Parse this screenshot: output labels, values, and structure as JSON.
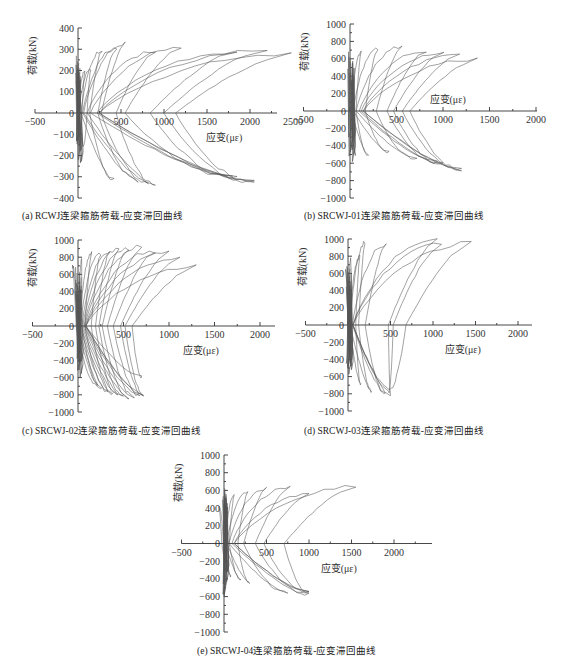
{
  "figure": {
    "panels": [
      {
        "id": "a",
        "caption": "(a) RCWJ连梁箍筋荷载-应变滞回曲线"
      },
      {
        "id": "b",
        "caption": "(b) SRCWJ-01连梁箍筋荷载-应变滞回曲线"
      },
      {
        "id": "c",
        "caption": "(c) SRCWJ-02连梁箍筋荷载-应变滞回曲线"
      },
      {
        "id": "d",
        "caption": "(d) SRCWJ-03连梁箍筋荷载-应变滞回曲线"
      },
      {
        "id": "e",
        "caption": "(e) SRCWJ-04连梁箍筋荷载-应变滞回曲线"
      }
    ]
  },
  "chart_data": [
    {
      "id": "a",
      "type": "line",
      "title": "(a) RCWJ连梁箍筋荷载-应变滞回曲线",
      "xlabel": "应变(με)",
      "ylabel": "荷载(kN)",
      "xticks": [
        -500,
        0,
        500,
        1000,
        1500,
        2000,
        2500
      ],
      "xtick_labels": [
        "-500",
        "",
        "500",
        "1000",
        "1500",
        "2000",
        "2500"
      ],
      "yticks": [
        -400,
        -300,
        -200,
        -100,
        0,
        100,
        200,
        300,
        400
      ],
      "ylim": [
        -400,
        400
      ],
      "xlim": [
        -500,
        2800
      ],
      "grid": false,
      "frame": {
        "x0": 78,
        "y_top": 28,
        "y_bot": 198,
        "px_per_500": 43,
        "x_axis_end": 277
      },
      "loops": [
        {
          "peak_strain": 80,
          "peak_load": 200,
          "neg_strain": 20,
          "neg_load": -180
        },
        {
          "peak_strain": 150,
          "peak_load": 210,
          "neg_strain": 60,
          "neg_load": -160
        },
        {
          "peak_strain": 280,
          "peak_load": 300,
          "neg_strain": 420,
          "neg_load": -320
        },
        {
          "peak_strain": 450,
          "peak_load": 310,
          "neg_strain": 700,
          "neg_load": -320
        },
        {
          "peak_strain": 550,
          "peak_load": 330,
          "neg_strain": 820,
          "neg_load": -330
        },
        {
          "peak_strain": 900,
          "peak_load": 290,
          "neg_strain": 900,
          "neg_load": -340
        },
        {
          "peak_strain": 1200,
          "peak_load": 310,
          "neg_strain": 1800,
          "neg_load": -300
        },
        {
          "peak_strain": 1850,
          "peak_load": 290,
          "neg_strain": 1850,
          "neg_load": -310
        },
        {
          "peak_strain": 2200,
          "peak_load": 300,
          "neg_strain": 2050,
          "neg_load": -330
        },
        {
          "peak_strain": 2480,
          "peak_load": 280,
          "neg_strain": 2050,
          "neg_load": -330
        }
      ]
    },
    {
      "id": "b",
      "type": "line",
      "title": "(b) SRCWJ-01连梁箍筋荷载-应变滞回曲线",
      "xlabel": "应变(με)",
      "ylabel": "荷载(kN)",
      "xticks": [
        -500,
        0,
        500,
        1000,
        1500,
        2000
      ],
      "xtick_labels": [
        "-500",
        "",
        "500",
        "1000",
        "1500",
        "2000"
      ],
      "yticks": [
        -1000,
        -800,
        -600,
        -400,
        -200,
        0,
        200,
        400,
        600,
        800,
        1000
      ],
      "ylim": [
        -1000,
        1000
      ],
      "xlim": [
        -500,
        2000
      ],
      "grid": false,
      "frame": {
        "x0": 350,
        "y_top": 24,
        "y_bot": 198,
        "px_per_500": 46.5,
        "x_axis_end": 537
      },
      "loops": [
        {
          "peak_strain": 30,
          "peak_load": 580,
          "neg_strain": 60,
          "neg_load": -520
        },
        {
          "peak_strain": 120,
          "peak_load": 680,
          "neg_strain": 200,
          "neg_load": -520
        },
        {
          "peak_strain": 300,
          "peak_load": 730,
          "neg_strain": 420,
          "neg_load": -480
        },
        {
          "peak_strain": 560,
          "peak_load": 750,
          "neg_strain": 720,
          "neg_load": -560
        },
        {
          "peak_strain": 820,
          "peak_load": 700,
          "neg_strain": 940,
          "neg_load": -600
        },
        {
          "peak_strain": 1010,
          "peak_load": 680,
          "neg_strain": 1000,
          "neg_load": -620
        },
        {
          "peak_strain": 1180,
          "peak_load": 650,
          "neg_strain": 1200,
          "neg_load": -680
        },
        {
          "peak_strain": 1370,
          "peak_load": 600,
          "neg_strain": 1200,
          "neg_load": -680
        }
      ]
    },
    {
      "id": "c",
      "type": "line",
      "title": "(c) SRCWJ-02连梁箍筋荷载-应变滞回曲线",
      "xlabel": "应变(με)",
      "ylabel": "荷载(kN)",
      "xticks": [
        -500,
        0,
        500,
        1000,
        1500,
        2000
      ],
      "xtick_labels": [
        "-500",
        "",
        "500",
        "1000",
        "1500",
        "2000"
      ],
      "yticks": [
        -1000,
        -800,
        -600,
        -400,
        -200,
        0,
        200,
        400,
        600,
        800,
        1000
      ],
      "ylim": [
        -1000,
        1000
      ],
      "xlim": [
        -500,
        2200
      ],
      "grid": false,
      "frame": {
        "x0": 78,
        "y_top": 240,
        "y_bot": 412,
        "px_per_500": 45.5,
        "x_axis_end": 275
      },
      "loops": [
        {
          "peak_strain": -60,
          "peak_load": 700,
          "neg_strain": 220,
          "neg_load": -700
        },
        {
          "peak_strain": 40,
          "peak_load": 780,
          "neg_strain": 260,
          "neg_load": -740
        },
        {
          "peak_strain": 150,
          "peak_load": 850,
          "neg_strain": 330,
          "neg_load": -780
        },
        {
          "peak_strain": 250,
          "peak_load": 860,
          "neg_strain": 380,
          "neg_load": -800
        },
        {
          "peak_strain": 350,
          "peak_load": 880,
          "neg_strain": 440,
          "neg_load": -820
        },
        {
          "peak_strain": 450,
          "peak_load": 900,
          "neg_strain": 500,
          "neg_load": -830
        },
        {
          "peak_strain": 560,
          "peak_load": 910,
          "neg_strain": 560,
          "neg_load": -840
        },
        {
          "peak_strain": 700,
          "peak_load": 930,
          "neg_strain": 620,
          "neg_load": -840
        },
        {
          "peak_strain": 850,
          "peak_load": 880,
          "neg_strain": 680,
          "neg_load": -820
        },
        {
          "peak_strain": 1000,
          "peak_load": 860,
          "neg_strain": 720,
          "neg_load": -820
        },
        {
          "peak_strain": 1120,
          "peak_load": 800,
          "neg_strain": 720,
          "neg_load": -800
        },
        {
          "peak_strain": 1300,
          "peak_load": 700,
          "neg_strain": 700,
          "neg_load": -600
        }
      ]
    },
    {
      "id": "d",
      "type": "line",
      "title": "(d) SRCWJ-03连梁箍筋荷载-应变滞回曲线",
      "xlabel": "应变(με)",
      "ylabel": "荷载(kN)",
      "xticks": [
        -500,
        0,
        500,
        1000,
        1500,
        2000
      ],
      "xtick_labels": [
        "-500",
        "",
        "500",
        "1000",
        "1500",
        "2000"
      ],
      "yticks": [
        -1000,
        -800,
        -600,
        -400,
        -200,
        0,
        200,
        400,
        600,
        800,
        1000
      ],
      "ylim": [
        -1000,
        1000
      ],
      "xlim": [
        -500,
        2200
      ],
      "grid": false,
      "frame": {
        "x0": 348,
        "y_top": 239,
        "y_bot": 411,
        "px_per_500": 42.5,
        "x_axis_end": 532
      },
      "loops": [
        {
          "peak_strain": -30,
          "peak_load": 650,
          "neg_strain": -20,
          "neg_load": -450
        },
        {
          "peak_strain": 30,
          "peak_load": 780,
          "neg_strain": 40,
          "neg_load": -480
        },
        {
          "peak_strain": 140,
          "peak_load": 800,
          "neg_strain": 150,
          "neg_load": -700
        },
        {
          "peak_strain": 200,
          "peak_load": 960,
          "neg_strain": 280,
          "neg_load": -780
        },
        {
          "peak_strain": 450,
          "peak_load": 950,
          "neg_strain": 440,
          "neg_load": -800
        },
        {
          "peak_strain": 1050,
          "peak_load": 1000,
          "neg_strain": 500,
          "neg_load": -820
        },
        {
          "peak_strain": 1100,
          "peak_load": 950,
          "neg_strain": 480,
          "neg_load": -780
        },
        {
          "peak_strain": 1450,
          "peak_load": 960,
          "neg_strain": 480,
          "neg_load": -760
        }
      ]
    },
    {
      "id": "e",
      "type": "line",
      "title": "(e) SRCWJ-04连梁箍筋荷载-应变滞回曲线",
      "xlabel": "应变(με)",
      "ylabel": "荷载(kN)",
      "xticks": [
        -500,
        0,
        500,
        1000,
        1500,
        2000
      ],
      "xtick_labels": [
        "-500",
        "",
        "500",
        "1000",
        "1500",
        "2000"
      ],
      "yticks": [
        -1000,
        -800,
        -600,
        -400,
        -200,
        0,
        200,
        400,
        600,
        800,
        1000
      ],
      "ylim": [
        -1000,
        1000
      ],
      "xlim": [
        -500,
        2300
      ],
      "grid": false,
      "frame": {
        "x0": 224,
        "y_top": 455,
        "y_bot": 632,
        "px_per_500": 42.5,
        "x_axis_end": 432
      },
      "loops": [
        {
          "peak_strain": -60,
          "peak_load": 420,
          "neg_strain": 40,
          "neg_load": -260
        },
        {
          "peak_strain": 20,
          "peak_load": 520,
          "neg_strain": 80,
          "neg_load": -380
        },
        {
          "peak_strain": 120,
          "peak_load": 550,
          "neg_strain": 200,
          "neg_load": -420
        },
        {
          "peak_strain": 280,
          "peak_load": 580,
          "neg_strain": 300,
          "neg_load": -450
        },
        {
          "peak_strain": 500,
          "peak_load": 630,
          "neg_strain": 750,
          "neg_load": -560
        },
        {
          "peak_strain": 780,
          "peak_load": 640,
          "neg_strain": 1000,
          "neg_load": -580
        },
        {
          "peak_strain": 1000,
          "peak_load": 560,
          "neg_strain": 1000,
          "neg_load": -560
        },
        {
          "peak_strain": 1550,
          "peak_load": 650,
          "neg_strain": 1000,
          "neg_load": -560
        }
      ]
    }
  ]
}
